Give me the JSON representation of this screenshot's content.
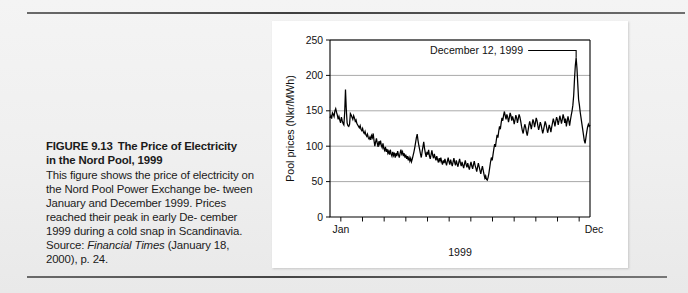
{
  "caption": {
    "figure_number": "FIGURE 9.13",
    "title": "The Price of Electricity",
    "title_line2": "in the Nord Pool, 1999",
    "body_line1": "This figure shows the price of electricity",
    "body_line2": "on the Nord Pool Power Exchange be-",
    "body_line3": "tween January and December 1999.",
    "body_line4": "Prices reached their peak in early De-",
    "body_line5": "cember 1999 during a cold snap in",
    "body_line6_pre": "Scandinavia. Source: ",
    "body_line6_italic": "Financial Times",
    "body_line7": "(January 18, 2000), p. 24."
  },
  "chart_data": {
    "type": "line",
    "title": "",
    "xlabel": "1999",
    "ylabel": "Pool prices (Nkr/MWh)",
    "ylim": [
      0,
      250
    ],
    "yticks": [
      0,
      50,
      100,
      150,
      200,
      250
    ],
    "ytick_labels": [
      "0",
      "50",
      "100",
      "150",
      "200",
      "250"
    ],
    "grid": true,
    "legend": "none",
    "xtick_labels": [
      "Jan",
      "Dec"
    ],
    "xtick_count": 12,
    "xtick_months": [
      "Jan",
      "Feb",
      "Mar",
      "Apr",
      "May",
      "Jun",
      "Jul",
      "Aug",
      "Sep",
      "Oct",
      "Nov",
      "Dec"
    ],
    "annotations": [
      {
        "text": "December 12, 1999",
        "points_to_value": 225,
        "points_to_x": "Dec 12"
      }
    ],
    "series": [
      {
        "name": "Pool price",
        "units": "Nkr/MWh",
        "values": [
          140,
          143,
          139,
          147,
          145,
          142,
          150,
          153,
          148,
          144,
          138,
          142,
          137,
          133,
          141,
          136,
          132,
          130,
          147,
          180,
          152,
          133,
          129,
          128,
          131,
          146,
          144,
          141,
          138,
          143,
          140,
          135,
          137,
          132,
          130,
          128,
          126,
          129,
          124,
          122,
          125,
          120,
          118,
          121,
          116,
          114,
          117,
          112,
          110,
          113,
          109,
          115,
          112,
          118,
          108,
          100,
          106,
          111,
          104,
          99,
          107,
          103,
          108,
          101,
          98,
          104,
          97,
          94,
          99,
          92,
          96,
          90,
          93,
          88,
          95,
          89,
          86,
          92,
          87,
          91,
          84,
          90,
          86,
          93,
          88,
          84,
          90,
          95,
          89,
          92,
          86,
          90,
          84,
          88,
          82,
          86,
          80,
          84,
          79,
          83,
          78,
          82,
          87,
          92,
          98,
          105,
          112,
          117,
          108,
          101,
          95,
          89,
          84,
          92,
          99,
          106,
          97,
          90,
          85,
          92,
          88,
          95,
          86,
          82,
          88,
          94,
          87,
          83,
          89,
          84,
          80,
          86,
          81,
          77,
          83,
          79,
          84,
          78,
          74,
          80,
          76,
          82,
          77,
          73,
          79,
          84,
          78,
          74,
          81,
          76,
          72,
          78,
          83,
          77,
          73,
          80,
          75,
          71,
          77,
          82,
          76,
          72,
          78,
          73,
          69,
          75,
          80,
          74,
          70,
          76,
          71,
          67,
          73,
          78,
          72,
          68,
          74,
          79,
          73,
          69,
          64,
          70,
          76,
          71,
          66,
          61,
          67,
          72,
          66,
          60,
          55,
          58,
          53,
          52,
          56,
          62,
          70,
          78,
          84,
          80,
          88,
          96,
          103,
          99,
          108,
          116,
          112,
          121,
          128,
          124,
          133,
          140,
          136,
          144,
          149,
          143,
          138,
          145,
          141,
          134,
          140,
          147,
          143,
          136,
          142,
          138,
          131,
          137,
          144,
          140,
          133,
          139,
          145,
          141,
          135,
          128,
          122,
          118,
          125,
          131,
          127,
          120,
          115,
          122,
          129,
          135,
          130,
          124,
          131,
          138,
          134,
          127,
          133,
          140,
          136,
          129,
          123,
          128,
          134,
          130,
          124,
          118,
          123,
          129,
          135,
          131,
          125,
          119,
          124,
          130,
          126,
          120,
          127,
          133,
          139,
          134,
          128,
          135,
          141,
          137,
          130,
          136,
          143,
          138,
          132,
          138,
          145,
          140,
          133,
          139,
          128,
          135,
          142,
          136,
          129,
          137,
          144,
          150,
          158,
          172,
          195,
          214,
          225,
          210,
          188,
          166,
          158,
          148,
          140,
          132,
          124,
          116,
          108,
          104,
          112,
          120,
          127,
          131,
          128,
          130
        ]
      }
    ]
  }
}
